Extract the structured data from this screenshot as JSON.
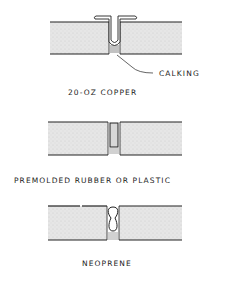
{
  "diagram": {
    "type": "expansion-joint-details",
    "details": [
      {
        "id": "copper",
        "caption": "20-OZ COPPER",
        "callout": "CALKING"
      },
      {
        "id": "premolded",
        "caption": "PREMOLDED RUBBER OR PLASTIC"
      },
      {
        "id": "neoprene",
        "caption": "NEOPRENE"
      }
    ],
    "colors": {
      "line": "#222222",
      "slab_fill": "#e4e4e4",
      "background": "#ffffff"
    }
  }
}
